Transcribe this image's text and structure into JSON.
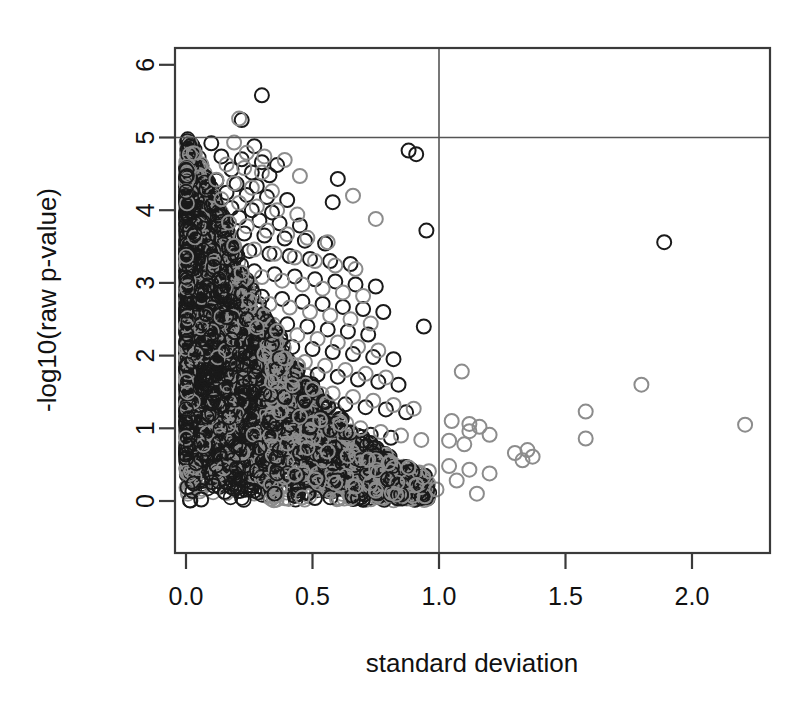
{
  "chart_data": {
    "type": "scatter",
    "title": "",
    "xlabel": "standard deviation",
    "ylabel": "-log10(raw p-value)",
    "xlim": [
      -0.08,
      2.31
    ],
    "ylim": [
      -0.22,
      6.35
    ],
    "xticks": [
      0.0,
      0.5,
      1.0,
      1.5,
      2.0
    ],
    "xticklabels": [
      "0.0",
      "0.5",
      "1.0",
      "1.5",
      "2.0"
    ],
    "yticks": [
      0,
      1,
      2,
      3,
      4,
      5,
      6
    ],
    "yticklabels": [
      "0",
      "1",
      "2",
      "3",
      "4",
      "5",
      "6"
    ],
    "grid": false,
    "legend": "none",
    "marker": "open-circle",
    "marker_radius_px": 7,
    "reference_lines": [
      {
        "orientation": "horizontal",
        "value": 5.0,
        "color": "#555555"
      },
      {
        "orientation": "vertical",
        "value": 1.0,
        "color": "#555555"
      }
    ],
    "series": [
      {
        "name": "black-points",
        "color": "#1a1a1a",
        "points": [
          [
            0.3,
            5.58
          ],
          [
            0.22,
            5.24
          ],
          [
            0.1,
            4.92
          ],
          [
            0.27,
            4.88
          ],
          [
            0.88,
            4.82
          ],
          [
            0.91,
            4.77
          ],
          [
            0.14,
            4.74
          ],
          [
            0.22,
            4.7
          ],
          [
            0.3,
            4.66
          ],
          [
            0.36,
            4.62
          ],
          [
            0.18,
            4.56
          ],
          [
            0.26,
            4.52
          ],
          [
            0.33,
            4.48
          ],
          [
            0.6,
            4.43
          ],
          [
            0.12,
            4.41
          ],
          [
            0.2,
            4.36
          ],
          [
            0.28,
            4.33
          ],
          [
            0.08,
            4.28
          ],
          [
            0.16,
            4.24
          ],
          [
            0.24,
            4.21
          ],
          [
            0.32,
            4.18
          ],
          [
            0.4,
            4.14
          ],
          [
            0.58,
            4.11
          ],
          [
            0.1,
            4.06
          ],
          [
            0.18,
            4.03
          ],
          [
            0.26,
            4.0
          ],
          [
            0.34,
            3.97
          ],
          [
            0.13,
            3.93
          ],
          [
            0.21,
            3.9
          ],
          [
            0.29,
            3.86
          ],
          [
            0.37,
            3.82
          ],
          [
            0.45,
            3.79
          ],
          [
            0.07,
            3.75
          ],
          [
            0.15,
            3.72
          ],
          [
            0.23,
            3.68
          ],
          [
            0.31,
            3.65
          ],
          [
            0.39,
            3.61
          ],
          [
            0.47,
            3.58
          ],
          [
            0.55,
            3.54
          ],
          [
            0.95,
            3.72
          ],
          [
            1.89,
            3.56
          ],
          [
            0.09,
            3.5
          ],
          [
            0.17,
            3.47
          ],
          [
            0.25,
            3.44
          ],
          [
            0.33,
            3.4
          ],
          [
            0.41,
            3.37
          ],
          [
            0.49,
            3.33
          ],
          [
            0.57,
            3.3
          ],
          [
            0.65,
            3.26
          ],
          [
            0.11,
            3.22
          ],
          [
            0.19,
            3.19
          ],
          [
            0.27,
            3.16
          ],
          [
            0.35,
            3.12
          ],
          [
            0.43,
            3.09
          ],
          [
            0.51,
            3.05
          ],
          [
            0.59,
            3.02
          ],
          [
            0.67,
            2.98
          ],
          [
            0.75,
            2.95
          ],
          [
            0.06,
            2.91
          ],
          [
            0.14,
            2.88
          ],
          [
            0.22,
            2.85
          ],
          [
            0.3,
            2.81
          ],
          [
            0.38,
            2.78
          ],
          [
            0.46,
            2.74
          ],
          [
            0.54,
            2.71
          ],
          [
            0.62,
            2.67
          ],
          [
            0.7,
            2.64
          ],
          [
            0.78,
            2.6
          ],
          [
            0.08,
            2.57
          ],
          [
            0.16,
            2.53
          ],
          [
            0.24,
            2.5
          ],
          [
            0.32,
            2.47
          ],
          [
            0.4,
            2.43
          ],
          [
            0.48,
            2.4
          ],
          [
            0.56,
            2.36
          ],
          [
            0.64,
            2.33
          ],
          [
            0.72,
            2.29
          ],
          [
            0.94,
            2.4
          ],
          [
            0.1,
            2.26
          ],
          [
            0.18,
            2.22
          ],
          [
            0.26,
            2.19
          ],
          [
            0.34,
            2.16
          ],
          [
            0.42,
            2.12
          ],
          [
            0.5,
            2.09
          ],
          [
            0.58,
            2.05
          ],
          [
            0.66,
            2.02
          ],
          [
            0.74,
            1.98
          ],
          [
            0.82,
            1.95
          ],
          [
            0.12,
            1.91
          ],
          [
            0.2,
            1.88
          ],
          [
            0.28,
            1.85
          ],
          [
            0.36,
            1.81
          ],
          [
            0.44,
            1.78
          ],
          [
            0.52,
            1.74
          ],
          [
            0.6,
            1.71
          ],
          [
            0.68,
            1.67
          ],
          [
            0.76,
            1.64
          ],
          [
            0.84,
            1.6
          ],
          [
            0.07,
            1.57
          ],
          [
            0.15,
            1.53
          ],
          [
            0.23,
            1.5
          ],
          [
            0.31,
            1.47
          ],
          [
            0.39,
            1.43
          ],
          [
            0.47,
            1.4
          ],
          [
            0.55,
            1.36
          ],
          [
            0.63,
            1.33
          ],
          [
            0.71,
            1.29
          ],
          [
            0.79,
            1.26
          ],
          [
            0.87,
            1.22
          ],
          [
            0.09,
            1.19
          ],
          [
            0.17,
            1.15
          ],
          [
            0.25,
            1.12
          ],
          [
            0.33,
            1.08
          ],
          [
            0.41,
            1.05
          ],
          [
            0.49,
            1.01
          ],
          [
            0.57,
            0.98
          ],
          [
            0.65,
            0.94
          ],
          [
            0.73,
            0.91
          ],
          [
            0.81,
            0.87
          ],
          [
            0.05,
            0.84
          ],
          [
            0.13,
            0.8
          ],
          [
            0.21,
            0.77
          ],
          [
            0.29,
            0.73
          ],
          [
            0.37,
            0.7
          ],
          [
            0.45,
            0.66
          ],
          [
            0.53,
            0.63
          ],
          [
            0.61,
            0.59
          ],
          [
            0.69,
            0.56
          ],
          [
            0.04,
            0.52
          ],
          [
            0.12,
            0.49
          ],
          [
            0.2,
            0.45
          ],
          [
            0.28,
            0.42
          ],
          [
            0.36,
            0.38
          ],
          [
            0.44,
            0.35
          ],
          [
            0.52,
            0.31
          ],
          [
            0.6,
            0.28
          ],
          [
            0.03,
            0.24
          ],
          [
            0.11,
            0.21
          ],
          [
            0.19,
            0.17
          ],
          [
            0.27,
            0.14
          ],
          [
            0.35,
            0.1
          ],
          [
            0.43,
            0.07
          ],
          [
            0.51,
            0.04
          ],
          [
            0.06,
            0.02
          ]
        ]
      },
      {
        "name": "gray-points",
        "color": "#8c8c8c",
        "points": [
          [
            0.21,
            5.26
          ],
          [
            0.19,
            4.93
          ],
          [
            0.24,
            4.79
          ],
          [
            0.31,
            4.74
          ],
          [
            0.39,
            4.69
          ],
          [
            0.16,
            4.63
          ],
          [
            0.23,
            4.58
          ],
          [
            0.3,
            4.52
          ],
          [
            0.45,
            4.47
          ],
          [
            0.12,
            4.42
          ],
          [
            0.19,
            4.37
          ],
          [
            0.26,
            4.31
          ],
          [
            0.34,
            4.26
          ],
          [
            0.66,
            4.2
          ],
          [
            0.14,
            4.15
          ],
          [
            0.21,
            4.1
          ],
          [
            0.28,
            4.05
          ],
          [
            0.36,
            4.0
          ],
          [
            0.44,
            3.94
          ],
          [
            0.75,
            3.88
          ],
          [
            0.17,
            3.83
          ],
          [
            0.24,
            3.78
          ],
          [
            0.32,
            3.72
          ],
          [
            0.4,
            3.67
          ],
          [
            0.48,
            3.62
          ],
          [
            0.56,
            3.56
          ],
          [
            0.19,
            3.51
          ],
          [
            0.27,
            3.46
          ],
          [
            0.35,
            3.4
          ],
          [
            0.43,
            3.35
          ],
          [
            0.51,
            3.3
          ],
          [
            0.59,
            3.24
          ],
          [
            0.67,
            3.19
          ],
          [
            0.22,
            3.14
          ],
          [
            0.3,
            3.08
          ],
          [
            0.38,
            3.03
          ],
          [
            0.46,
            2.98
          ],
          [
            0.54,
            2.92
          ],
          [
            0.62,
            2.87
          ],
          [
            0.7,
            2.82
          ],
          [
            0.25,
            2.76
          ],
          [
            0.33,
            2.71
          ],
          [
            0.41,
            2.66
          ],
          [
            0.49,
            2.6
          ],
          [
            0.57,
            2.55
          ],
          [
            0.65,
            2.5
          ],
          [
            0.73,
            2.44
          ],
          [
            0.28,
            2.39
          ],
          [
            0.36,
            2.34
          ],
          [
            0.44,
            2.28
          ],
          [
            0.52,
            2.23
          ],
          [
            0.6,
            2.18
          ],
          [
            0.68,
            2.12
          ],
          [
            0.76,
            2.07
          ],
          [
            0.31,
            2.02
          ],
          [
            0.39,
            1.96
          ],
          [
            0.47,
            1.91
          ],
          [
            0.55,
            1.86
          ],
          [
            0.63,
            1.8
          ],
          [
            0.71,
            1.75
          ],
          [
            0.79,
            1.7
          ],
          [
            1.09,
            1.78
          ],
          [
            0.34,
            1.64
          ],
          [
            0.42,
            1.59
          ],
          [
            0.5,
            1.54
          ],
          [
            0.58,
            1.48
          ],
          [
            0.66,
            1.43
          ],
          [
            0.74,
            1.38
          ],
          [
            0.82,
            1.32
          ],
          [
            0.9,
            1.27
          ],
          [
            1.8,
            1.6
          ],
          [
            1.58,
            1.23
          ],
          [
            2.21,
            1.05
          ],
          [
            1.58,
            0.86
          ],
          [
            0.37,
            1.22
          ],
          [
            0.45,
            1.16
          ],
          [
            0.53,
            1.11
          ],
          [
            0.61,
            1.06
          ],
          [
            0.69,
            1.0
          ],
          [
            0.77,
            0.95
          ],
          [
            0.85,
            0.9
          ],
          [
            0.93,
            0.84
          ],
          [
            1.05,
            1.1
          ],
          [
            1.12,
            1.06
          ],
          [
            1.16,
            1.02
          ],
          [
            1.12,
            0.96
          ],
          [
            1.2,
            0.91
          ],
          [
            1.04,
            0.83
          ],
          [
            1.1,
            0.78
          ],
          [
            1.35,
            0.7
          ],
          [
            1.3,
            0.66
          ],
          [
            1.37,
            0.61
          ],
          [
            1.33,
            0.56
          ],
          [
            0.4,
            0.79
          ],
          [
            0.48,
            0.73
          ],
          [
            0.56,
            0.68
          ],
          [
            0.64,
            0.62
          ],
          [
            0.72,
            0.57
          ],
          [
            0.8,
            0.52
          ],
          [
            0.88,
            0.46
          ],
          [
            0.96,
            0.41
          ],
          [
            1.04,
            0.48
          ],
          [
            1.12,
            0.43
          ],
          [
            1.2,
            0.38
          ],
          [
            0.43,
            0.36
          ],
          [
            0.51,
            0.3
          ],
          [
            0.59,
            0.25
          ],
          [
            0.67,
            0.2
          ],
          [
            0.75,
            0.14
          ],
          [
            0.83,
            0.09
          ],
          [
            0.91,
            0.22
          ],
          [
            0.99,
            0.16
          ],
          [
            1.07,
            0.28
          ],
          [
            1.15,
            0.1
          ],
          [
            0.46,
            0.05
          ]
        ]
      }
    ]
  },
  "axes": {
    "x_title": "standard deviation",
    "y_title": "-log10(raw p-value)"
  }
}
